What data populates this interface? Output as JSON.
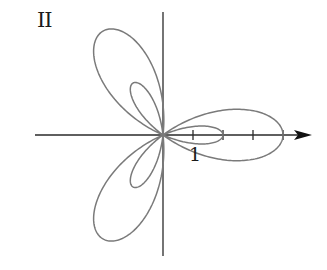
{
  "panel_label": "II",
  "tick_label": "1",
  "curve": {
    "equation": "r = 1 + 3cos(3θ)",
    "a": 1,
    "b": 3,
    "k": 3,
    "color": "#7a7a7a"
  },
  "axes": {
    "origin_px": [
      163,
      135
    ],
    "unit_px": 30,
    "x_axis": {
      "from_px": 35,
      "to_px": 312,
      "ticks": [
        1,
        2,
        3,
        4
      ],
      "arrow": true
    },
    "y_axis": {
      "from_px": 12,
      "to_px": 256
    },
    "color": "#2a2a2a"
  }
}
